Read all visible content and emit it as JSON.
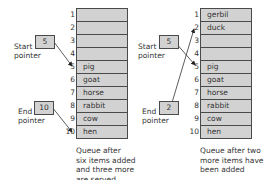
{
  "queues": [
    {
      "id": "left",
      "cells": [
        {
          "index": "1",
          "value": ""
        },
        {
          "index": "2",
          "value": ""
        },
        {
          "index": "3",
          "value": ""
        },
        {
          "index": "4",
          "value": ""
        },
        {
          "index": "5",
          "value": "pig"
        },
        {
          "index": "6",
          "value": "goat"
        },
        {
          "index": "7",
          "value": "horse"
        },
        {
          "index": "8",
          "value": "rabbit"
        },
        {
          "index": "9",
          "value": "cow"
        },
        {
          "index": "10",
          "value": "hen"
        }
      ],
      "start_pointer": {
        "label_line1": "Start",
        "label_line2": "pointer",
        "value": "5"
      },
      "end_pointer": {
        "label_line1": "End",
        "label_line2": "pointer",
        "value": "10"
      },
      "caption": [
        "Queue after",
        "six items added",
        "and three more",
        "are served"
      ]
    },
    {
      "id": "right",
      "cells": [
        {
          "index": "1",
          "value": "gerbil"
        },
        {
          "index": "2",
          "value": "duck"
        },
        {
          "index": "3",
          "value": ""
        },
        {
          "index": "4",
          "value": ""
        },
        {
          "index": "5",
          "value": "pig"
        },
        {
          "index": "6",
          "value": "goat"
        },
        {
          "index": "7",
          "value": "horse"
        },
        {
          "index": "8",
          "value": "rabbit"
        },
        {
          "index": "9",
          "value": "cow"
        },
        {
          "index": "10",
          "value": "hen"
        }
      ],
      "start_pointer": {
        "label_line1": "Start",
        "label_line2": "pointer",
        "value": "5"
      },
      "end_pointer": {
        "label_line1": "End",
        "label_line2": "pointer",
        "value": "2"
      },
      "caption": [
        "Queue after two",
        "more items have",
        "been added"
      ]
    }
  ],
  "colors": {
    "cell_fill": "#d2d2d2",
    "border": "#4a4a4a",
    "text": "#333333"
  }
}
